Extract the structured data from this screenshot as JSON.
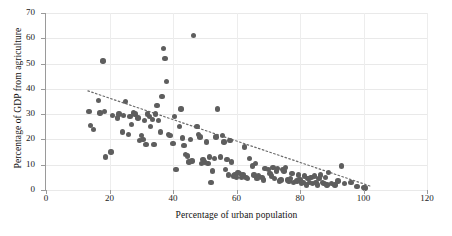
{
  "chart_data": {
    "type": "scatter",
    "title": "",
    "xlabel": "Percentage of urban population",
    "ylabel": "Percentage of GDP from agriculture",
    "xlim": [
      0,
      120
    ],
    "ylim": [
      0,
      70
    ],
    "xticks": [
      0,
      20,
      40,
      60,
      80,
      100,
      120
    ],
    "yticks": [
      0,
      10,
      20,
      30,
      40,
      50,
      60,
      70
    ],
    "grid": true,
    "legend": "none",
    "marker_color": "#5e5e5e",
    "trendline": {
      "style": "dotted",
      "color": "#6b6b6b",
      "points": [
        [
          13.2,
          39.2
        ],
        [
          102.0,
          1.6
        ]
      ]
    },
    "points": [
      [
        13.5,
        31.0
      ],
      [
        14.0,
        25.5
      ],
      [
        15.0,
        24.0
      ],
      [
        16.5,
        35.5
      ],
      [
        17.0,
        30.5
      ],
      [
        18.0,
        51.0
      ],
      [
        18.5,
        31.0
      ],
      [
        18.8,
        13.0
      ],
      [
        20.5,
        15.0
      ],
      [
        21.0,
        29.5
      ],
      [
        22.5,
        28.5
      ],
      [
        23.0,
        30.0
      ],
      [
        24.0,
        23.0
      ],
      [
        24.5,
        29.5
      ],
      [
        25.0,
        35.0
      ],
      [
        26.0,
        22.0
      ],
      [
        26.5,
        29.0
      ],
      [
        27.0,
        26.0
      ],
      [
        27.5,
        30.5
      ],
      [
        28.0,
        30.0
      ],
      [
        29.0,
        28.5
      ],
      [
        29.5,
        19.5
      ],
      [
        30.0,
        21.5
      ],
      [
        30.5,
        20.0
      ],
      [
        31.0,
        27.5
      ],
      [
        31.5,
        18.0
      ],
      [
        32.0,
        30.0
      ],
      [
        32.5,
        29.0
      ],
      [
        33.0,
        25.0
      ],
      [
        33.5,
        28.0
      ],
      [
        34.0,
        18.0
      ],
      [
        34.5,
        30.0
      ],
      [
        35.0,
        33.5
      ],
      [
        35.5,
        27.5
      ],
      [
        36.0,
        23.0
      ],
      [
        36.5,
        37.0
      ],
      [
        37.0,
        56.0
      ],
      [
        37.5,
        52.0
      ],
      [
        38.0,
        43.0
      ],
      [
        38.5,
        22.0
      ],
      [
        39.0,
        21.5
      ],
      [
        40.0,
        18.5
      ],
      [
        40.5,
        29.0
      ],
      [
        41.0,
        8.0
      ],
      [
        42.0,
        25.0
      ],
      [
        42.5,
        32.0
      ],
      [
        43.0,
        20.5
      ],
      [
        43.5,
        17.5
      ],
      [
        44.0,
        14.0
      ],
      [
        44.5,
        13.5
      ],
      [
        45.0,
        11.0
      ],
      [
        45.5,
        20.0
      ],
      [
        46.0,
        11.5
      ],
      [
        46.5,
        61.0
      ],
      [
        47.5,
        25.0
      ],
      [
        48.0,
        22.0
      ],
      [
        48.5,
        21.0
      ],
      [
        49.0,
        10.5
      ],
      [
        49.5,
        12.0
      ],
      [
        50.0,
        11.0
      ],
      [
        50.5,
        19.0
      ],
      [
        51.0,
        10.5
      ],
      [
        51.5,
        13.0
      ],
      [
        52.0,
        3.0
      ],
      [
        52.5,
        7.5
      ],
      [
        53.0,
        12.5
      ],
      [
        53.5,
        21.0
      ],
      [
        54.0,
        32.0
      ],
      [
        55.0,
        13.0
      ],
      [
        55.5,
        21.5
      ],
      [
        56.0,
        19.0
      ],
      [
        56.5,
        8.0
      ],
      [
        57.0,
        12.0
      ],
      [
        57.5,
        6.0
      ],
      [
        58.0,
        19.5
      ],
      [
        58.5,
        11.0
      ],
      [
        59.0,
        5.5
      ],
      [
        59.5,
        6.0
      ],
      [
        60.0,
        5.0
      ],
      [
        60.5,
        7.0
      ],
      [
        61.0,
        6.5
      ],
      [
        61.5,
        5.0
      ],
      [
        62.0,
        6.0
      ],
      [
        62.5,
        17.0
      ],
      [
        63.0,
        5.0
      ],
      [
        63.5,
        4.5
      ],
      [
        64.0,
        12.5
      ],
      [
        65.0,
        9.5
      ],
      [
        65.5,
        6.0
      ],
      [
        66.0,
        10.5
      ],
      [
        66.5,
        4.5
      ],
      [
        67.0,
        5.5
      ],
      [
        68.0,
        5.0
      ],
      [
        68.5,
        4.0
      ],
      [
        69.0,
        8.5
      ],
      [
        70.0,
        8.0
      ],
      [
        70.5,
        6.5
      ],
      [
        71.0,
        5.5
      ],
      [
        71.5,
        9.0
      ],
      [
        72.0,
        4.5
      ],
      [
        72.5,
        7.5
      ],
      [
        73.0,
        8.5
      ],
      [
        73.5,
        3.5
      ],
      [
        74.0,
        4.0
      ],
      [
        74.5,
        8.0
      ],
      [
        75.0,
        7.5
      ],
      [
        75.5,
        9.0
      ],
      [
        76.0,
        4.0
      ],
      [
        76.5,
        3.5
      ],
      [
        77.0,
        4.5
      ],
      [
        77.5,
        6.5
      ],
      [
        78.0,
        3.0
      ],
      [
        79.0,
        3.5
      ],
      [
        79.5,
        6.0
      ],
      [
        80.0,
        4.0
      ],
      [
        80.5,
        2.5
      ],
      [
        81.0,
        3.0
      ],
      [
        81.5,
        5.5
      ],
      [
        82.0,
        2.0
      ],
      [
        82.5,
        4.5
      ],
      [
        83.0,
        3.0
      ],
      [
        83.5,
        5.0
      ],
      [
        84.0,
        2.5
      ],
      [
        84.5,
        5.5
      ],
      [
        85.0,
        3.0
      ],
      [
        85.5,
        2.0
      ],
      [
        86.0,
        4.5
      ],
      [
        86.5,
        6.0
      ],
      [
        87.0,
        3.0
      ],
      [
        87.5,
        2.5
      ],
      [
        88.0,
        5.0
      ],
      [
        88.5,
        2.0
      ],
      [
        89.0,
        7.0
      ],
      [
        90.0,
        2.5
      ],
      [
        91.0,
        2.0
      ],
      [
        92.0,
        3.5
      ],
      [
        93.0,
        9.5
      ],
      [
        94.0,
        2.5
      ],
      [
        96.0,
        3.0
      ],
      [
        98.0,
        1.5
      ],
      [
        100.0,
        1.0
      ],
      [
        100.5,
        0.8
      ]
    ]
  }
}
